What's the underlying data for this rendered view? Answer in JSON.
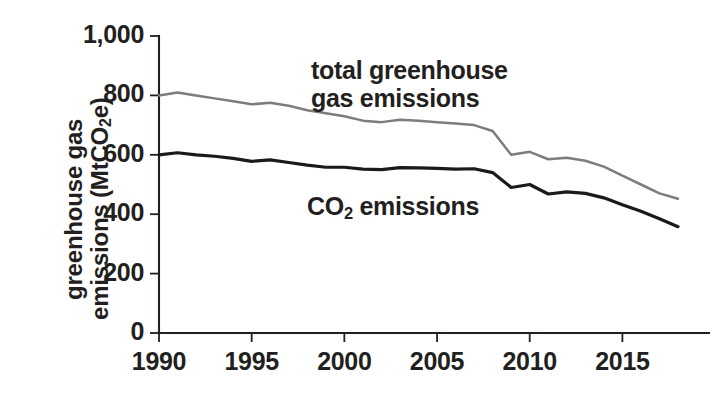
{
  "chart_data": {
    "type": "line",
    "title": "",
    "xlabel": "",
    "ylabel": "greenhouse gas emissions (MtCO2e)",
    "ylabel_line1": "greenhouse gas",
    "ylabel_line2_prefix": "emissions (MtCO",
    "ylabel_line2_sub": "2",
    "ylabel_line2_suffix": "e)",
    "xlim": [
      1990,
      2018
    ],
    "ylim": [
      0,
      1000
    ],
    "grid": false,
    "legend_position": "inline-annotation",
    "x": [
      1990,
      1991,
      1992,
      1993,
      1994,
      1995,
      1996,
      1997,
      1998,
      1999,
      2000,
      2001,
      2002,
      2003,
      2004,
      2005,
      2006,
      2007,
      2008,
      2009,
      2010,
      2011,
      2012,
      2013,
      2014,
      2015,
      2016,
      2017,
      2018
    ],
    "series": [
      {
        "name": "total greenhouse gas emissions",
        "color": "#7d7d7d",
        "values": [
          800,
          810,
          800,
          790,
          780,
          770,
          775,
          765,
          750,
          740,
          730,
          715,
          710,
          718,
          715,
          710,
          705,
          700,
          680,
          600,
          610,
          585,
          590,
          580,
          560,
          530,
          500,
          470,
          452
        ]
      },
      {
        "name": "CO2 emissions",
        "color": "#1a1a1a",
        "values": [
          600,
          607,
          600,
          595,
          588,
          578,
          583,
          574,
          565,
          558,
          558,
          552,
          550,
          557,
          556,
          554,
          552,
          553,
          540,
          490,
          500,
          468,
          475,
          470,
          455,
          432,
          410,
          385,
          358
        ]
      }
    ],
    "y_ticks": [
      0,
      200,
      400,
      600,
      800,
      1000
    ],
    "y_tick_labels": [
      "0",
      "200",
      "400",
      "600",
      "800",
      "1,000"
    ],
    "x_ticks": [
      1990,
      1995,
      2000,
      2005,
      2010,
      2015
    ],
    "x_tick_labels": [
      "1990",
      "1995",
      "2000",
      "2005",
      "2010",
      "2015"
    ],
    "annotations": [
      {
        "id": "total-ghg",
        "line1": "total greenhouse",
        "line2": "gas emissions"
      },
      {
        "id": "co2",
        "prefix": "CO",
        "sub": "2",
        "suffix": " emissions"
      }
    ]
  }
}
